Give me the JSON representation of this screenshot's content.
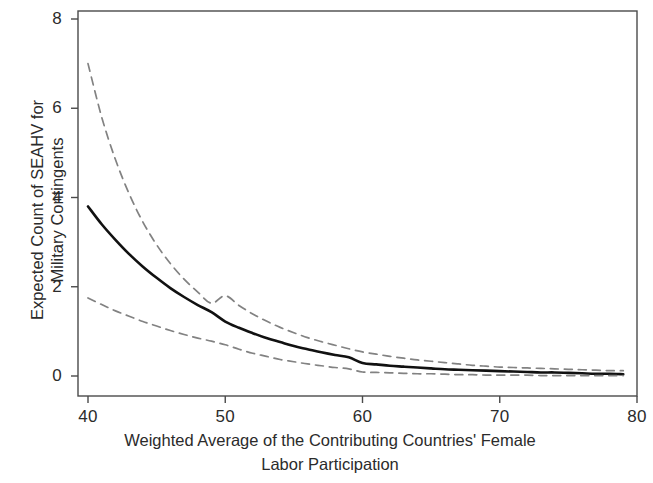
{
  "chart_data": {
    "type": "line",
    "title": "",
    "subtitle": "",
    "xlabel_lines": [
      "Weighted Average of the Contributing Countries' Female",
      "Labor Participation"
    ],
    "ylabel_lines": [
      "Expected Count of SEAHV for",
      "Military Contingents"
    ],
    "xlabel": "Weighted Average of the Contributing Countries' Female Labor Participation",
    "ylabel": "Expected Count of SEAHV for Military Contingents",
    "xlim": [
      38.5,
      80
    ],
    "ylim": [
      -0.25,
      8.25
    ],
    "xticks": [
      40,
      50,
      60,
      70,
      80
    ],
    "xtick_labels": [
      "40",
      "50",
      "60",
      "70",
      "80"
    ],
    "yticks": [
      0,
      2,
      4,
      6,
      8
    ],
    "ytick_labels": [
      "0",
      "2",
      "4",
      "6",
      "8"
    ],
    "grid": false,
    "legend": "none",
    "frame": "box",
    "colors": {
      "estimate": "#111111",
      "confidence_band": "#828282",
      "axis": "#4a4a4a",
      "text": "#2b2b2b",
      "background": "#ffffff"
    },
    "x": [
      40,
      41,
      42,
      43,
      44,
      45,
      46,
      47,
      48,
      49,
      50,
      51,
      52,
      53,
      54,
      55,
      56,
      57,
      58,
      59,
      60,
      61,
      62,
      63,
      64,
      65,
      66,
      67,
      68,
      69,
      70,
      71,
      72,
      73,
      74,
      75,
      76,
      77,
      78,
      79
    ],
    "series": [
      {
        "name": "Upper 95% confidence limit",
        "style": "dashed",
        "color": "#828282",
        "values": [
          7.0,
          5.8,
          4.85,
          4.08,
          3.45,
          2.94,
          2.52,
          2.17,
          1.88,
          1.63,
          1.8,
          1.58,
          1.39,
          1.23,
          1.09,
          0.97,
          0.86,
          0.77,
          0.69,
          0.61,
          0.54,
          0.49,
          0.44,
          0.4,
          0.36,
          0.33,
          0.3,
          0.27,
          0.24,
          0.22,
          0.2,
          0.19,
          0.18,
          0.17,
          0.16,
          0.15,
          0.14,
          0.13,
          0.12,
          0.12
        ]
      },
      {
        "name": "Expected count (point estimate)",
        "style": "solid",
        "color": "#111111",
        "values": [
          3.8,
          3.4,
          3.05,
          2.73,
          2.45,
          2.2,
          1.97,
          1.77,
          1.59,
          1.43,
          1.22,
          1.08,
          0.96,
          0.85,
          0.76,
          0.67,
          0.6,
          0.53,
          0.47,
          0.42,
          0.29,
          0.26,
          0.23,
          0.21,
          0.19,
          0.17,
          0.15,
          0.14,
          0.13,
          0.12,
          0.11,
          0.1,
          0.09,
          0.08,
          0.08,
          0.07,
          0.06,
          0.05,
          0.05,
          0.04
        ]
      },
      {
        "name": "Lower 95% confidence limit",
        "style": "dashed",
        "color": "#828282",
        "values": [
          1.75,
          1.6,
          1.46,
          1.34,
          1.22,
          1.12,
          1.02,
          0.93,
          0.85,
          0.78,
          0.7,
          0.6,
          0.51,
          0.44,
          0.37,
          0.32,
          0.27,
          0.23,
          0.19,
          0.16,
          0.09,
          0.08,
          0.07,
          0.06,
          0.05,
          0.05,
          0.04,
          0.03,
          0.03,
          0.02,
          0.02,
          0.02,
          0.02,
          0.01,
          0.01,
          0.01,
          0.01,
          0.01,
          0.01,
          0.01
        ]
      }
    ],
    "data_x_range": [
      40,
      79
    ],
    "annotations": []
  }
}
